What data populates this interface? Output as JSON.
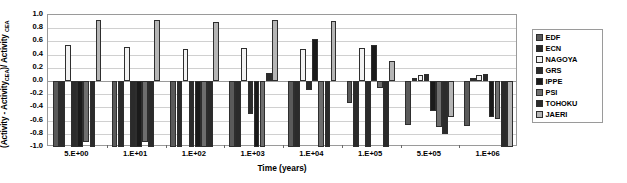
{
  "chart_data": {
    "type": "bar",
    "title": "",
    "xlabel": "Time (years)",
    "ylabel": "(Activity - Activity CEA)/ Activity CEA",
    "ylabel_main": "(Activity - Activity",
    "ylabel_sub1": "CEA",
    "ylabel_mid": ")/ Activity ",
    "ylabel_sub2": "CEA",
    "categories": [
      "5.E+00",
      "1.E+01",
      "1.E+02",
      "1.E+03",
      "1.E+04",
      "1.E+05",
      "5.E+05",
      "1.E+06"
    ],
    "ylim": [
      -1.0,
      1.0
    ],
    "yticks": [
      "1.0",
      "0.8",
      "0.6",
      "0.4",
      "0.2",
      "0.0",
      "-0.2",
      "-0.4",
      "-0.6",
      "-0.8",
      "-1.0"
    ],
    "ytick_values": [
      1.0,
      0.8,
      0.6,
      0.4,
      0.2,
      0.0,
      -0.2,
      -0.4,
      -0.6,
      -0.8,
      -1.0
    ],
    "grid": true,
    "legend_position": "right",
    "series": [
      {
        "name": "EDF",
        "color": "#5a5a5a",
        "values": [
          -1.0,
          -1.0,
          -1.0,
          -1.0,
          -1.0,
          -0.33,
          -0.67,
          -0.68
        ]
      },
      {
        "name": "ECN",
        "color": "#2b2b2b",
        "values": [
          -1.0,
          -1.0,
          -1.0,
          -1.0,
          -1.0,
          -1.0,
          0.05,
          0.05
        ]
      },
      {
        "name": "NAGOYA",
        "color": "#f2f2f2",
        "values": [
          0.55,
          0.52,
          0.49,
          0.5,
          0.48,
          0.5,
          0.09,
          0.09
        ]
      },
      {
        "name": "GRS",
        "color": "#2b2b2b",
        "values": [
          -1.0,
          -1.0,
          -1.0,
          -0.5,
          -0.13,
          -1.0,
          0.1,
          0.1
        ]
      },
      {
        "name": "IPPE",
        "color": "#1a1a1a",
        "values": [
          -1.0,
          -1.0,
          -1.0,
          -1.0,
          0.63,
          0.55,
          -0.45,
          -0.54
        ]
      },
      {
        "name": "PSI",
        "color": "#6e6e6e",
        "values": [
          -0.93,
          -0.92,
          -1.05,
          -1.0,
          -1.0,
          -0.1,
          -0.7,
          -0.57
        ]
      },
      {
        "name": "TOHOKU",
        "color": "#2b2b2b",
        "values": [
          -1.0,
          -1.0,
          -1.0,
          0.12,
          -1.0,
          -1.0,
          -0.8,
          -1.0
        ]
      },
      {
        "name": "JAERI",
        "color": "#b5b5b5",
        "values": [
          0.92,
          0.92,
          0.9,
          0.92,
          0.91,
          0.3,
          -0.55,
          -1.0
        ]
      }
    ]
  },
  "legend": {
    "items": [
      {
        "label": "EDF"
      },
      {
        "label": "ECN"
      },
      {
        "label": "NAGOYA"
      },
      {
        "label": "GRS"
      },
      {
        "label": "IPPE"
      },
      {
        "label": "PSI"
      },
      {
        "label": "TOHOKU"
      },
      {
        "label": "JAERI"
      }
    ]
  }
}
